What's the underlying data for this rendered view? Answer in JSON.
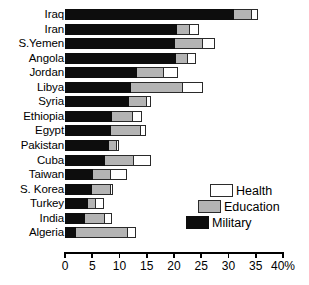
{
  "chart_data": {
    "type": "bar",
    "orientation": "horizontal",
    "stacked": true,
    "title": "",
    "subtitle": "",
    "xlabel": "",
    "ylabel": "",
    "xlim": [
      0,
      40
    ],
    "xticks": [
      0,
      5,
      10,
      15,
      20,
      25,
      30,
      35,
      40
    ],
    "xtick_labels": [
      "0",
      "5",
      "10",
      "15",
      "20",
      "25",
      "30",
      "35",
      "40%"
    ],
    "grid": false,
    "legend_position": "inside-lower-right",
    "categories": [
      "Iraq",
      "Iran",
      "S.Yemen",
      "Angola",
      "Jordan",
      "Libya",
      "Syria",
      "Ethiopia",
      "Egypt",
      "Pakistan",
      "Cuba",
      "Taiwan",
      "S. Korea",
      "Turkey",
      "India",
      "Algeria"
    ],
    "series": [
      {
        "name": "Military",
        "color": "#0d0d0d",
        "values": [
          31.0,
          20.6,
          20.1,
          20.4,
          13.3,
          12.2,
          11.8,
          8.7,
          8.5,
          8.1,
          7.4,
          5.2,
          5.0,
          4.2,
          3.7,
          2.0
        ]
      },
      {
        "name": "Education",
        "color": "#b4b4b4",
        "values": [
          3.3,
          2.4,
          5.2,
          2.2,
          4.8,
          9.4,
          3.3,
          3.8,
          5.5,
          1.5,
          5.3,
          3.3,
          3.5,
          1.5,
          3.7,
          9.6
        ]
      },
      {
        "name": "Health",
        "color": "#ffffff",
        "values": [
          1.1,
          1.5,
          2.3,
          1.5,
          2.7,
          3.7,
          0.6,
          1.7,
          0.9,
          0.4,
          3.0,
          2.8,
          0.3,
          1.5,
          1.3,
          1.5
        ]
      }
    ],
    "totals": [
      35.4,
      24.5,
      27.6,
      24.1,
      20.8,
      25.3,
      15.7,
      14.2,
      14.9,
      10.0,
      15.7,
      11.3,
      8.8,
      7.2,
      8.7,
      13.1
    ]
  },
  "legend": {
    "items": [
      {
        "label": "Health",
        "swatch": "health"
      },
      {
        "label": "Education",
        "swatch": "education"
      },
      {
        "label": "Military",
        "swatch": "military"
      }
    ]
  }
}
